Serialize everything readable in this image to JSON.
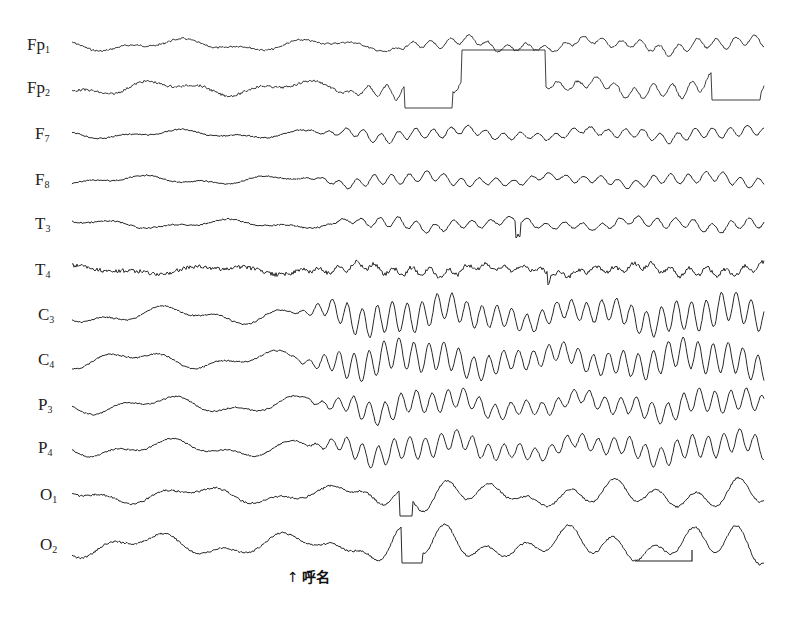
{
  "figure": {
    "type": "EEG recording",
    "annotation": {
      "arrow": "↑",
      "text": "呼名"
    },
    "calibration_bar": {
      "x1": 635,
      "x2": 692,
      "y": 561,
      "tick_top": 550
    },
    "trace_color": "#2a2a2a",
    "x_start": 72,
    "x_end": 764
  },
  "channels": [
    {
      "id": "Fp1",
      "base": "Fp",
      "sub": "1",
      "label_x": 27,
      "y": 45,
      "amp": 4,
      "onset": 380,
      "amp2": 5,
      "freq2": 0.33,
      "noise": 1.0
    },
    {
      "id": "Fp2",
      "base": "Fp",
      "sub": "2",
      "label_x": 27,
      "y": 88,
      "amp": 5,
      "onset": 330,
      "amp2": 7,
      "freq2": 0.33,
      "noise": 1.2
    },
    {
      "id": "F7",
      "base": "F",
      "sub": "7",
      "label_x": 35,
      "y": 134,
      "amp": 3,
      "onset": 300,
      "amp2": 5,
      "freq2": 0.36,
      "noise": 0.7
    },
    {
      "id": "F8",
      "base": "F",
      "sub": "8",
      "label_x": 35,
      "y": 180,
      "amp": 3,
      "onset": 300,
      "amp2": 5,
      "freq2": 0.36,
      "noise": 0.7
    },
    {
      "id": "T3",
      "base": "T",
      "sub": "3",
      "label_x": 35,
      "y": 224,
      "amp": 3,
      "onset": 320,
      "amp2": 5,
      "freq2": 0.34,
      "noise": 0.8
    },
    {
      "id": "T4",
      "base": "T",
      "sub": "4",
      "label_x": 35,
      "y": 270,
      "amp": 3,
      "onset": 280,
      "amp2": 4,
      "freq2": 0.34,
      "noise": 2.0
    },
    {
      "id": "C3",
      "base": "C",
      "sub": "3",
      "label_x": 38,
      "y": 315,
      "amp": 6,
      "onset": 290,
      "amp2": 15,
      "freq2": 0.42,
      "noise": 0.8
    },
    {
      "id": "C4",
      "base": "C",
      "sub": "4",
      "label_x": 38,
      "y": 360,
      "amp": 6,
      "onset": 290,
      "amp2": 15,
      "freq2": 0.42,
      "noise": 0.8
    },
    {
      "id": "P3",
      "base": "P",
      "sub": "3",
      "label_x": 38,
      "y": 405,
      "amp": 6,
      "onset": 300,
      "amp2": 11,
      "freq2": 0.4,
      "noise": 0.8
    },
    {
      "id": "P4",
      "base": "P",
      "sub": "4",
      "label_x": 38,
      "y": 448,
      "amp": 6,
      "onset": 300,
      "amp2": 11,
      "freq2": 0.4,
      "noise": 0.8
    },
    {
      "id": "O1",
      "base": "O",
      "sub": "1",
      "label_x": 40,
      "y": 495,
      "amp": 6,
      "onset": 330,
      "amp2": 10,
      "freq2": 0.15,
      "noise": 1.0
    },
    {
      "id": "O2",
      "base": "O",
      "sub": "2",
      "label_x": 40,
      "y": 545,
      "amp": 8,
      "onset": 330,
      "amp2": 12,
      "freq2": 0.15,
      "noise": 1.0
    }
  ],
  "artifacts": [
    {
      "channel": "Fp2",
      "kind": "clip-low",
      "x1": 405,
      "x2": 452,
      "level": 108
    },
    {
      "channel": "Fp2",
      "kind": "clip-high",
      "x1": 462,
      "x2": 545,
      "level": 50
    },
    {
      "channel": "Fp2",
      "kind": "clip-low",
      "x1": 712,
      "x2": 760,
      "level": 100
    },
    {
      "channel": "O1",
      "kind": "clip-low",
      "x1": 400,
      "x2": 412,
      "level": 516
    },
    {
      "channel": "O2",
      "kind": "clip-low",
      "x1": 402,
      "x2": 422,
      "level": 563
    },
    {
      "channel": "T3",
      "kind": "spike",
      "x1": 516,
      "x2": 520,
      "level": 236
    },
    {
      "channel": "T4",
      "kind": "spike",
      "x1": 548,
      "x2": 550,
      "level": 282
    }
  ]
}
